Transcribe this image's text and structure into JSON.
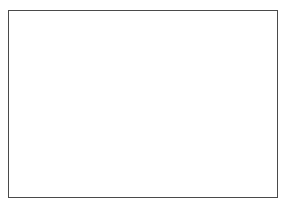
{
  "drawing": {
    "title": "Building Section",
    "type": "architectural-section",
    "canvas": {
      "width": 288,
      "height": 210,
      "background": "#ffffff"
    },
    "frame": {
      "label": "outer-frame",
      "x": 8,
      "y": 10,
      "width": 270,
      "height": 188,
      "border_color": "#4a4a4a"
    },
    "bands": [
      {
        "label": "upper-slab",
        "x": 9,
        "y": 11,
        "width": 268,
        "height": 41,
        "fill": "#e2e2e2",
        "edge_line_color": "#5a5a5a"
      },
      {
        "label": "lower-slab",
        "x": 9,
        "y": 157,
        "width": 268,
        "height": 40,
        "fill": "#e2e2e2",
        "edge_line_color": "#5a5a5a"
      }
    ],
    "vertical_band": {
      "label": "central-bay-overlay",
      "x": 97,
      "y": 11,
      "width": 93,
      "height": 186,
      "fill": "rgba(140,140,140,0.22)",
      "edge_color": "#6e6e6e"
    },
    "hatched_region": {
      "label": "masonry-infill",
      "x": 99,
      "y": 52,
      "width": 89,
      "height": 105,
      "pattern": "diagonal-hatch-45",
      "hatch_color": "#808080",
      "hatch_spacing_px": 4.6,
      "fill": "#f7f7f7",
      "border_color": "#6a6a6a"
    },
    "block": {
      "label": "core-block",
      "x": 147,
      "y": 83,
      "width": 38,
      "height": 44,
      "fill": "#a3a3a3",
      "border_color": "#6d6d6d"
    },
    "dimension": {
      "label": "clear-width-dimension",
      "x": 101,
      "y": 104,
      "width": 46,
      "line_color": "#2f2f2f",
      "arrowheads": [
        "left",
        "right"
      ],
      "tick": {
        "x_offset": 22,
        "y": 96,
        "height": 9
      }
    },
    "ladders": [
      {
        "label": "column-assembly-left-outer",
        "x": 16,
        "y": 48,
        "width": 26,
        "height": 109,
        "post_color": "#4f4f4f",
        "rung_color": "#6a6a6a",
        "rung_count": 8,
        "rung_top": 10
      },
      {
        "label": "column-assembly-left-inner",
        "x": 62,
        "y": 48,
        "width": 26,
        "height": 109,
        "post_color": "#4f4f4f",
        "rung_color": "#6a6a6a",
        "rung_count": 8,
        "rung_top": 10
      },
      {
        "label": "column-assembly-right-inner",
        "x": 200,
        "y": 48,
        "width": 26,
        "height": 109,
        "post_color": "#4f4f4f",
        "rung_color": "#6a6a6a",
        "rung_count": 8,
        "rung_top": 10
      },
      {
        "label": "column-assembly-right-outer",
        "x": 246,
        "y": 48,
        "width": 26,
        "height": 109,
        "post_color": "#4f4f4f",
        "rung_color": "#6a6a6a",
        "rung_count": 8,
        "rung_top": 10
      }
    ],
    "edge_stubs": [
      {
        "label": "left-edge-stub",
        "x": 8,
        "y": 52,
        "width": 1,
        "height": 105
      },
      {
        "label": "right-edge-stub",
        "x": 277,
        "y": 52,
        "width": 1,
        "height": 105
      }
    ]
  }
}
